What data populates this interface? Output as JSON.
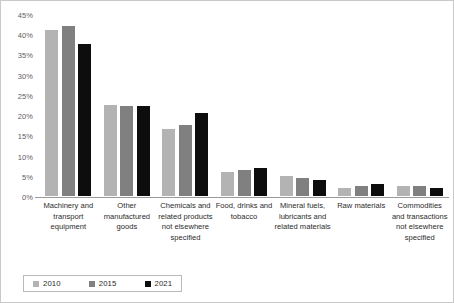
{
  "chart_data": {
    "type": "bar",
    "title": "",
    "subtitle": "",
    "xlabel": "",
    "ylabel": "",
    "ylim": [
      0,
      45
    ],
    "ytick_step": 5,
    "ytick_labels": [
      "45%",
      "40%",
      "35%",
      "30%",
      "25%",
      "20%",
      "15%",
      "10%",
      "5%",
      "0%"
    ],
    "ytick_values": [
      45,
      40,
      35,
      30,
      25,
      20,
      15,
      10,
      5,
      0
    ],
    "grid": false,
    "legend_position": "bottom",
    "value_unit": "%",
    "categories": [
      "Machinery and transport equipment",
      "Other manufactured goods",
      "Chemicals and related products not elsewhere specified",
      "Food, drinks and tobacco",
      "Mineral fuels, lubricants and related materials",
      "Raw materials",
      "Commodities and transactions not elsewhere specified"
    ],
    "series": [
      {
        "name": "2010",
        "color": "#b3b3b3",
        "values": [
          41.5,
          23.0,
          17.0,
          6.5,
          5.5,
          2.5,
          3.0
        ]
      },
      {
        "name": "2015",
        "color": "#808080",
        "values": [
          42.5,
          22.8,
          18.0,
          7.0,
          5.0,
          3.0,
          3.0
        ]
      },
      {
        "name": "2021",
        "color": "#0d0d0d",
        "values": [
          38.0,
          22.8,
          21.0,
          7.5,
          4.5,
          3.5,
          2.5
        ]
      }
    ]
  },
  "legend": {
    "items": [
      {
        "label": "2010",
        "color": "#b3b3b3"
      },
      {
        "label": "2015",
        "color": "#808080"
      },
      {
        "label": "2021",
        "color": "#0d0d0d"
      }
    ]
  },
  "colors": {
    "series_2010": "#b3b3b3",
    "series_2015": "#808080",
    "series_2021": "#0d0d0d",
    "axis": "#9a9a9a",
    "frame": "#c9c9c9",
    "tick_text": "#5e5e5e",
    "label_text": "#2b2b2b"
  }
}
